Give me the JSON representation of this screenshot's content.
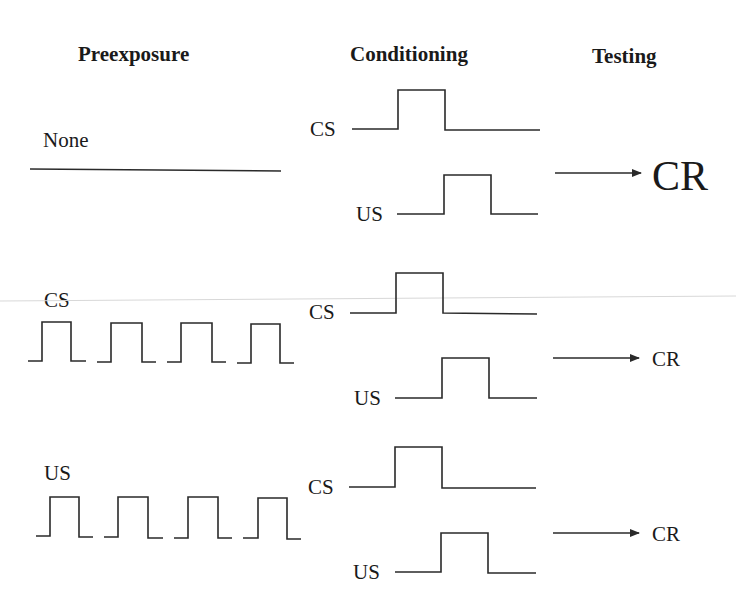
{
  "headers": {
    "preexposure": "Preexposure",
    "conditioning": "Conditioning",
    "testing": "Testing"
  },
  "rows": [
    {
      "preexposure_label": "None",
      "conditioning": {
        "cs_label": "CS",
        "us_label": "US"
      },
      "testing": {
        "response_label": "CR",
        "response_strength": "large"
      }
    },
    {
      "preexposure_label": "CS",
      "preexposure_pulses": 4,
      "conditioning": {
        "cs_label": "CS",
        "us_label": "US"
      },
      "testing": {
        "response_label": "CR",
        "response_strength": "small"
      }
    },
    {
      "preexposure_label": "US",
      "preexposure_pulses": 4,
      "conditioning": {
        "cs_label": "CS",
        "us_label": "US"
      },
      "testing": {
        "response_label": "CR",
        "response_strength": "small"
      }
    }
  ],
  "colors": {
    "ink": "#1a1a1a",
    "background": "#ffffff"
  }
}
